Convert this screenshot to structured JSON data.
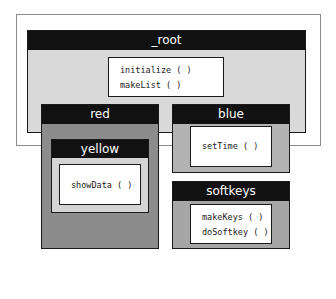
{
  "diagram": {
    "root": {
      "label": "_root",
      "methods": [
        "initialize ( )",
        "makeList ( )"
      ]
    },
    "red": {
      "label": "red",
      "children": {
        "yellow": {
          "label": "yellow",
          "methods": [
            "showData ( )"
          ]
        }
      }
    },
    "blue": {
      "label": "blue",
      "methods": [
        "setTime ( )"
      ]
    },
    "softkeys": {
      "label": "softkeys",
      "methods": [
        "makeKeys ( )",
        "doSoftkey ( )"
      ]
    }
  },
  "colors": {
    "header": "#111111",
    "root_body": "#d9d9d9",
    "red_body": "#8c8c8c",
    "yellow_body": "#d4d4d4",
    "blue_body": "#b3b3b3",
    "softkeys_body": "#a6a6a6",
    "method_box": "#ffffff"
  }
}
